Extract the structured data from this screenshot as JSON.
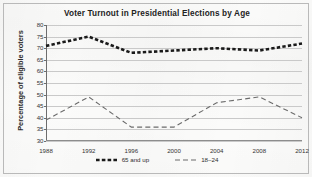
{
  "chart_data": {
    "type": "line",
    "title": "Voter Turnout in Presidential Elections by Age",
    "xlabel": "",
    "ylabel": "Percentage of eligible voters",
    "categories": [
      "1988",
      "1992",
      "1996",
      "2000",
      "2004",
      "2008",
      "2012"
    ],
    "x": [
      1988,
      1992,
      1996,
      2000,
      2004,
      2008,
      2012
    ],
    "ylim": [
      30,
      80
    ],
    "yticks": [
      30,
      35,
      40,
      45,
      50,
      55,
      60,
      65,
      70,
      75,
      80
    ],
    "grid": "horizontal",
    "legend_position": "bottom",
    "series": [
      {
        "name": "65 and up",
        "values": [
          71,
          75,
          68,
          69,
          70,
          69,
          72
        ],
        "color": "#1a1a1a",
        "style": "dashed",
        "width": 2.6
      },
      {
        "name": "18–24",
        "values": [
          39,
          49,
          36,
          36,
          46.5,
          49,
          40
        ],
        "color": "#6b6b6b",
        "style": "dashed",
        "width": 1.1
      }
    ]
  },
  "legend": {
    "items": [
      {
        "label": "65 and up"
      },
      {
        "label": "18–24"
      }
    ]
  },
  "colors": {
    "page_background": "#fbfbfa",
    "frame_border": "#b9b9b9",
    "gridline": "#c9c9c9",
    "axis": "#6d6d6d",
    "text": "#343434",
    "series_65_and_up": "#1a1a1a",
    "series_18_24": "#6b6b6b"
  }
}
